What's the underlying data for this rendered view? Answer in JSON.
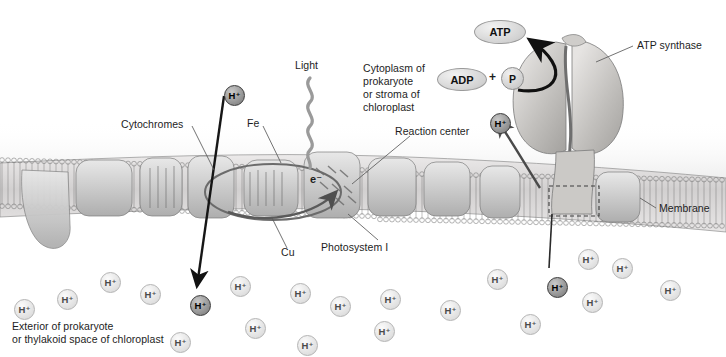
{
  "labels": {
    "light": "Light",
    "cytochromes": "Cytochromes",
    "fe": "Fe",
    "cu": "Cu",
    "electron": "e⁻",
    "photosystem_one": "Photosystem I",
    "reaction_center": "Reaction center",
    "atp_synthase": "ATP synthase",
    "membrane": "Membrane",
    "cytoplasm_line1": "Cytoplasm of",
    "cytoplasm_line2": "prokaryote",
    "cytoplasm_line3": "or stroma of",
    "cytoplasm_line4": "chloroplast",
    "exterior_line1": "Exterior of prokaryote",
    "exterior_line2": "or thylakoid space of chloroplast"
  },
  "molecules": {
    "atp": "ATP",
    "adp": "ADP",
    "plus": "+",
    "phosphate": "P",
    "proton": "H⁺"
  },
  "colors": {
    "ink": "#1d1d1d",
    "leader_line": "#5a5a5a",
    "arrow_dark": "#141414",
    "arrow_gray": "#585858",
    "light_wave": "#9a9a9a",
    "membrane_fill": "#d6d6d6",
    "protein_fill": "#c4c4c4",
    "proton_light": "#e4e4e4",
    "proton_dark": "#8e8e8e"
  },
  "protons": {
    "light_ions": [
      {
        "x": 100,
        "y": 272
      },
      {
        "x": 57,
        "y": 289
      },
      {
        "x": 14,
        "y": 299
      },
      {
        "x": 140,
        "y": 284
      },
      {
        "x": 230,
        "y": 276
      },
      {
        "x": 290,
        "y": 283
      },
      {
        "x": 330,
        "y": 296
      },
      {
        "x": 380,
        "y": 289
      },
      {
        "x": 245,
        "y": 318
      },
      {
        "x": 170,
        "y": 332
      },
      {
        "x": 440,
        "y": 300
      },
      {
        "x": 487,
        "y": 269
      },
      {
        "x": 520,
        "y": 314
      },
      {
        "x": 578,
        "y": 249
      },
      {
        "x": 612,
        "y": 258
      },
      {
        "x": 582,
        "y": 292
      },
      {
        "x": 660,
        "y": 280
      },
      {
        "x": 297,
        "y": 335
      },
      {
        "x": 374,
        "y": 321
      }
    ],
    "dark_ions": [
      {
        "x": 224,
        "y": 85,
        "role": "pumped-proton-top"
      },
      {
        "x": 190,
        "y": 295,
        "role": "proton-delivered-to-exterior"
      },
      {
        "x": 490,
        "y": 113,
        "role": "proton-entering-cytoplasm"
      },
      {
        "x": 547,
        "y": 277,
        "role": "proton-at-synthase-channel"
      }
    ]
  },
  "chart_data": {
    "type": "diagram",
    "components": [
      {
        "name": "Light",
        "note": "photon energy absorbed by reaction center"
      },
      {
        "name": "Reaction center",
        "note": "chlorophyll complex of Photosystem I"
      },
      {
        "name": "Photosystem I",
        "note": "light-harvesting complex"
      },
      {
        "name": "Cytochromes",
        "note": "electron carriers in membrane"
      },
      {
        "name": "Fe",
        "note": "iron carrier in electron transport chain"
      },
      {
        "name": "Cu",
        "note": "copper carrier in electron transport chain"
      },
      {
        "name": "ATP synthase",
        "note": "enzyme coupling proton flow to ATP synthesis"
      },
      {
        "name": "Membrane",
        "note": "phospholipid bilayer"
      }
    ],
    "compartments": [
      {
        "name": "Cytoplasm of prokaryote or stroma of chloroplast",
        "side": "top"
      },
      {
        "name": "Exterior of prokaryote or thylakoid space of chloroplast",
        "side": "bottom"
      }
    ],
    "reactions": [
      {
        "inputs": [
          "ADP",
          "P"
        ],
        "outputs": [
          "ATP"
        ],
        "site": "ATP synthase"
      }
    ]
  }
}
